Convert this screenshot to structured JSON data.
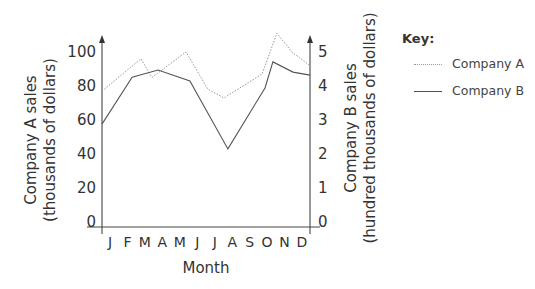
{
  "chart_data": {
    "type": "line",
    "title": "",
    "xlabel": "Month",
    "ylabel_left": [
      "Company A sales",
      "(thousands of dollars)"
    ],
    "ylabel_right": [
      "Company B sales",
      "(hundred thousands of dollars)"
    ],
    "categories": [
      "J",
      "F",
      "M",
      "A",
      "M",
      "J",
      "J",
      "A",
      "S",
      "O",
      "N",
      "D"
    ],
    "y_left": {
      "ticks": [
        0,
        20,
        40,
        60,
        80,
        100
      ],
      "ylim": [
        0,
        100
      ]
    },
    "y_right": {
      "ticks": [
        0,
        1,
        2,
        3,
        4,
        5
      ],
      "ylim": [
        0,
        5
      ]
    },
    "grid": false,
    "legend_position": "right",
    "series": [
      {
        "name": "Company A",
        "axis": "left",
        "style": "dotted",
        "points": [
          [
            0,
            77
          ],
          [
            2.06,
            96
          ],
          [
            2.64,
            85
          ],
          [
            4.44,
            100
          ],
          [
            5.61,
            78
          ],
          [
            6.45,
            73
          ],
          [
            8.46,
            87
          ],
          [
            9.25,
            111
          ],
          [
            10.05,
            100
          ],
          [
            11,
            92
          ]
        ]
      },
      {
        "name": "Company B",
        "axis": "right",
        "style": "solid",
        "points": [
          [
            0,
            2.88
          ],
          [
            1.59,
            4.26
          ],
          [
            2.96,
            4.47
          ],
          [
            4.65,
            4.15
          ],
          [
            6.66,
            2.15
          ],
          [
            8.62,
            3.94
          ],
          [
            9.04,
            4.71
          ],
          [
            10.1,
            4.41
          ],
          [
            11,
            4.32
          ]
        ]
      }
    ]
  },
  "legend": {
    "title": "Key:",
    "items": [
      {
        "label": "Company A",
        "style": "dotted"
      },
      {
        "label": "Company B",
        "style": "solid"
      }
    ]
  }
}
